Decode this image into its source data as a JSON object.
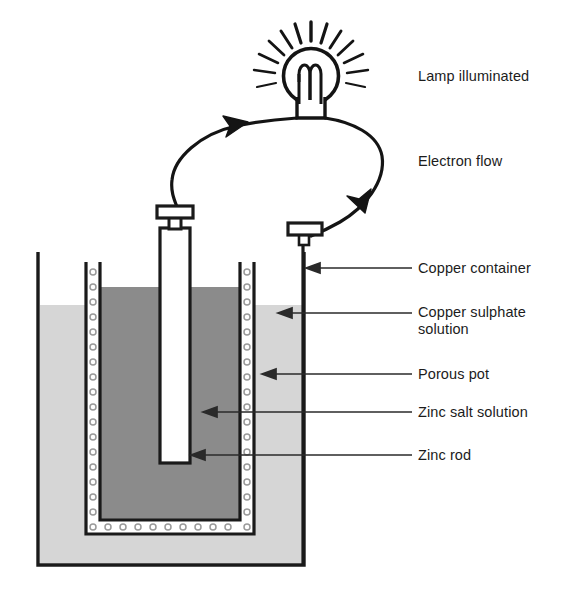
{
  "figure": {
    "type": "labelled-diagram"
  },
  "colors": {
    "outline": "#1a1a1a",
    "outer_solution_fill": "#d6d6d6",
    "inner_solution_fill": "#8b8b8b",
    "pot_wall_fill": "#ffffff",
    "rod_fill": "#ffffff",
    "label_text": "#1c1c1c",
    "leader_line": "#1a1a1a",
    "page_background": "#ffffff"
  },
  "labels": [
    {
      "id": "lamp",
      "text": "Lamp illuminated",
      "x": 418,
      "y": 76,
      "has_leader": false
    },
    {
      "id": "electron_flow",
      "text": "Electron flow",
      "x": 418,
      "y": 161,
      "has_leader": false
    },
    {
      "id": "copper_container",
      "text": "Copper container",
      "x": 418,
      "y": 260,
      "has_leader": true
    },
    {
      "id": "copper_sulphate",
      "text": "Copper sulphate\nsolution",
      "x": 418,
      "y": 304,
      "has_leader": true
    },
    {
      "id": "porous_pot",
      "text": "Porous pot",
      "x": 418,
      "y": 366,
      "has_leader": true
    },
    {
      "id": "zinc_salt",
      "text": "Zinc salt solution",
      "x": 418,
      "y": 404,
      "has_leader": true
    },
    {
      "id": "zinc_rod",
      "text": "Zinc rod",
      "x": 418,
      "y": 447,
      "has_leader": true
    }
  ],
  "icons": {
    "lamp": "lamp-bulb-icon",
    "filament": "filament-coil-icon",
    "rays": "light-rays-icon",
    "arrow_left": "electron-flow-arrow-left-icon",
    "arrow_right": "electron-flow-arrow-right-icon",
    "terminal_zinc": "zinc-terminal-clamp-icon",
    "terminal_copper": "copper-terminal-clamp-icon"
  },
  "components": {
    "lamp_centre": {
      "cx": 311,
      "cy": 75,
      "r": 28
    },
    "outer_container": {
      "x": 38,
      "y": 252,
      "w": 266,
      "h": 313
    },
    "porous_pot": {
      "x": 86,
      "y": 262,
      "w": 168,
      "h": 272
    },
    "zinc_rod": {
      "x": 160,
      "y": 228,
      "w": 30,
      "h": 235
    },
    "liquid_level_outer": 305,
    "liquid_level_inner": 287
  }
}
